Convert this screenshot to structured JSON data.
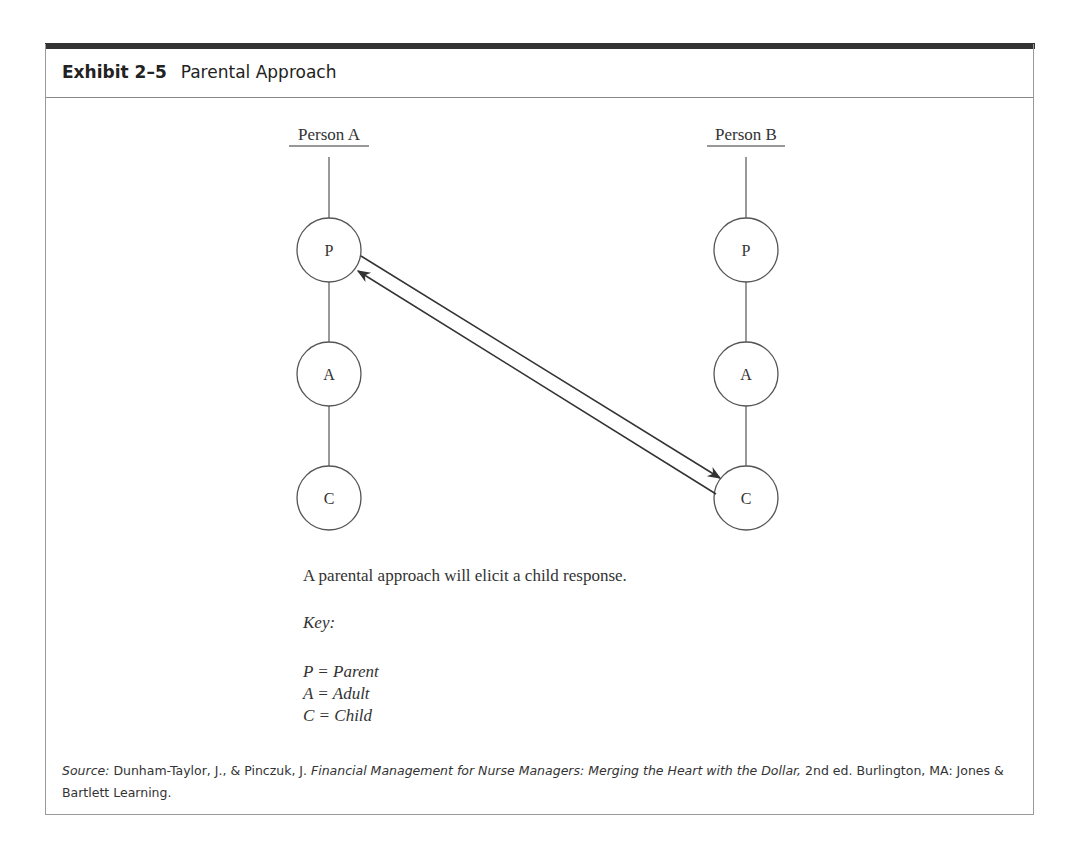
{
  "exhibit": {
    "number": "Exhibit 2–5",
    "title": "Parental Approach"
  },
  "diagram": {
    "persons": [
      {
        "label": "Person A",
        "nodes": [
          "P",
          "A",
          "C"
        ]
      },
      {
        "label": "Person B",
        "nodes": [
          "P",
          "A",
          "C"
        ]
      }
    ],
    "arrows": [
      {
        "from": "Person A: P",
        "to": "Person B: C"
      },
      {
        "from": "Person B: C",
        "to": "Person A: P"
      }
    ]
  },
  "caption": "A parental approach will elicit a child response.",
  "key": {
    "label": "Key:",
    "items": [
      "P = Parent",
      "A = Adult",
      "C = Child"
    ]
  },
  "source": {
    "prefix": "Source:",
    "authors": " Dunham-Taylor, J., & Pinczuk, J. ",
    "book_title": "Financial Management for Nurse Managers: Merging the Heart with the Dollar,",
    "rest": " 2nd ed. Burlington, MA: Jones & Bartlett Learning."
  }
}
